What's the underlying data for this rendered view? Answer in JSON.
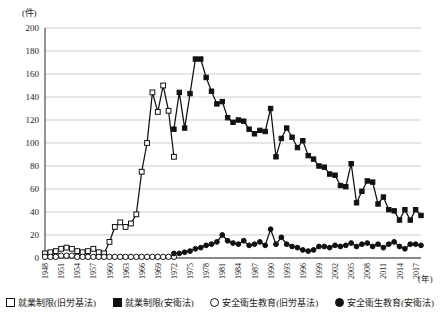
{
  "chart_data": {
    "type": "line",
    "title": "",
    "xlabel": "(年)",
    "ylabel": "(件)",
    "ylim": [
      0,
      200
    ],
    "ytick_step": 20,
    "yticks": [
      0,
      20,
      40,
      60,
      80,
      100,
      120,
      140,
      160,
      180,
      200
    ],
    "xlim": [
      1948,
      2018
    ],
    "xticks": [
      1948,
      1951,
      1954,
      1957,
      1960,
      1963,
      1966,
      1969,
      1972,
      1975,
      1978,
      1981,
      1984,
      1987,
      1990,
      1993,
      1996,
      1999,
      2002,
      2005,
      2008,
      2011,
      2014,
      2017
    ],
    "grid": "horizontal",
    "legend_position": "bottom",
    "x": [
      1948,
      1949,
      1950,
      1951,
      1952,
      1953,
      1954,
      1955,
      1956,
      1957,
      1958,
      1959,
      1960,
      1961,
      1962,
      1963,
      1964,
      1965,
      1966,
      1967,
      1968,
      1969,
      1970,
      1971,
      1972,
      1973,
      1974,
      1975,
      1976,
      1977,
      1978,
      1979,
      1980,
      1981,
      1982,
      1983,
      1984,
      1985,
      1986,
      1987,
      1988,
      1989,
      1990,
      1991,
      1992,
      1993,
      1994,
      1995,
      1996,
      1997,
      1998,
      1999,
      2000,
      2001,
      2002,
      2003,
      2004,
      2005,
      2006,
      2007,
      2008,
      2009,
      2010,
      2011,
      2012,
      2013,
      2014,
      2015,
      2016,
      2017,
      2018
    ],
    "series": [
      {
        "name": "就業制限(旧労基法)",
        "marker": "open-square",
        "color": "#111111",
        "x": [
          1948,
          1949,
          1950,
          1951,
          1952,
          1953,
          1954,
          1955,
          1956,
          1957,
          1958,
          1959,
          1960,
          1961,
          1962,
          1963,
          1964,
          1965,
          1966,
          1967,
          1968,
          1969,
          1970,
          1971,
          1972
        ],
        "values": [
          4,
          5,
          6,
          8,
          9,
          8,
          6,
          5,
          6,
          8,
          5,
          4,
          14,
          27,
          31,
          27,
          30,
          38,
          75,
          100,
          144,
          127,
          150,
          128,
          88
        ]
      },
      {
        "name": "就業制限(安衛法)",
        "marker": "filled-square",
        "color": "#111111",
        "x": [
          1972,
          1973,
          1974,
          1975,
          1976,
          1977,
          1978,
          1979,
          1980,
          1981,
          1982,
          1983,
          1984,
          1985,
          1986,
          1987,
          1988,
          1989,
          1990,
          1991,
          1992,
          1993,
          1994,
          1995,
          1996,
          1997,
          1998,
          1999,
          2000,
          2001,
          2002,
          2003,
          2004,
          2005,
          2006,
          2007,
          2008,
          2009,
          2010,
          2011,
          2012,
          2013,
          2014,
          2015,
          2016,
          2017,
          2018
        ],
        "values": [
          112,
          144,
          113,
          143,
          173,
          173,
          157,
          145,
          134,
          136,
          122,
          118,
          120,
          119,
          112,
          108,
          111,
          110,
          130,
          88,
          104,
          113,
          105,
          96,
          102,
          89,
          86,
          80,
          79,
          73,
          72,
          63,
          62,
          82,
          48,
          58,
          67,
          66,
          47,
          53,
          42,
          41,
          33,
          42,
          33,
          42,
          37
        ]
      },
      {
        "name": "安全衛生教育(旧労基法)",
        "marker": "open-circle",
        "color": "#111111",
        "x": [
          1948,
          1949,
          1950,
          1951,
          1952,
          1953,
          1954,
          1955,
          1956,
          1957,
          1958,
          1959,
          1960,
          1961,
          1962,
          1963,
          1964,
          1965,
          1966,
          1967,
          1968,
          1969,
          1970,
          1971,
          1972
        ],
        "values": [
          1,
          1,
          1,
          2,
          2,
          2,
          1,
          1,
          1,
          1,
          1,
          1,
          1,
          1,
          1,
          1,
          1,
          1,
          1,
          1,
          1,
          1,
          1,
          1,
          1
        ]
      },
      {
        "name": "安全衛生教育(安衛法)",
        "marker": "filled-circle",
        "color": "#111111",
        "x": [
          1972,
          1973,
          1974,
          1975,
          1976,
          1977,
          1978,
          1979,
          1980,
          1981,
          1982,
          1983,
          1984,
          1985,
          1986,
          1987,
          1988,
          1989,
          1990,
          1991,
          1992,
          1993,
          1994,
          1995,
          1996,
          1997,
          1998,
          1999,
          2000,
          2001,
          2002,
          2003,
          2004,
          2005,
          2006,
          2007,
          2008,
          2009,
          2010,
          2011,
          2012,
          2013,
          2014,
          2015,
          2016,
          2017,
          2018
        ],
        "values": [
          4,
          4,
          5,
          6,
          8,
          9,
          11,
          12,
          14,
          20,
          15,
          13,
          12,
          15,
          11,
          12,
          14,
          11,
          25,
          12,
          18,
          12,
          10,
          9,
          7,
          6,
          7,
          10,
          10,
          9,
          11,
          10,
          11,
          13,
          10,
          12,
          13,
          10,
          12,
          9,
          12,
          14,
          10,
          8,
          12,
          12,
          11
        ]
      }
    ]
  },
  "legend": {
    "items": [
      {
        "label": "就業制限(旧労基法)",
        "marker": "open-square"
      },
      {
        "label": "就業制限(安衛法)",
        "marker": "filled-square"
      },
      {
        "label": "安全衛生教育(旧労基法)",
        "marker": "open-circle"
      },
      {
        "label": "安全衛生教育(安衛法)",
        "marker": "filled-circle"
      }
    ]
  },
  "axes": {
    "y_unit": "(件)",
    "x_unit": "(年)"
  }
}
